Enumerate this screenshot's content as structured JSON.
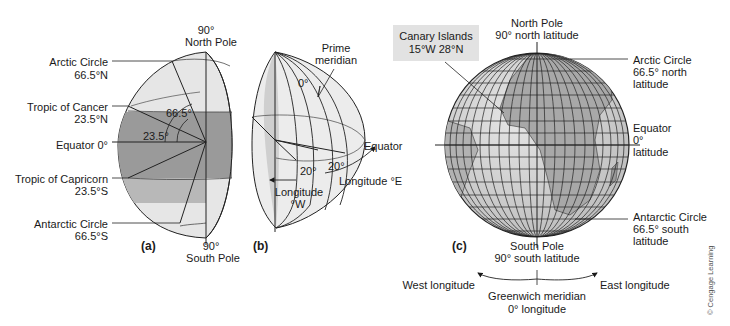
{
  "panel_a": {
    "tag": "(a)",
    "north_pole": {
      "deg": "90°",
      "name": "North Pole"
    },
    "south_pole": {
      "deg": "90°",
      "name": "South Pole"
    },
    "arctic_circle": {
      "name": "Arctic Circle",
      "value": "66.5°N"
    },
    "tropic_cancer": {
      "name": "Tropic of Cancer",
      "value": "23.5°N"
    },
    "equator": {
      "name": "Equator 0°"
    },
    "tropic_capricorn": {
      "name": "Tropic of Capricorn",
      "value": "23.5°S"
    },
    "antarctic_circle": {
      "name": "Antarctic Circle",
      "value": "66.5°S"
    },
    "angle_large": "66.5°",
    "angle_small": "23.5°"
  },
  "panel_b": {
    "tag": "(b)",
    "prime_meridian": {
      "line1": "Prime",
      "line2": "meridian"
    },
    "zero": "0°",
    "equator": "Equator",
    "angle_w": "20°",
    "angle_e": "20°",
    "longitude_e": "Longitude °E",
    "longitude_w": {
      "line1": "Longitude",
      "line2": "°W"
    }
  },
  "panel_c": {
    "tag": "(c)",
    "canary_islands": {
      "name": "Canary Islands",
      "coords": "15°W 28°N"
    },
    "north_pole": {
      "name": "North Pole",
      "lat": "90° north latitude"
    },
    "arctic_circle": {
      "line1": "Arctic Circle",
      "line2": "66.5° north",
      "line3": "latitude"
    },
    "equator": {
      "line1": "Equator",
      "line2": "0°",
      "line3": "latitude"
    },
    "antarctic_circle": {
      "line1": "Antarctic Circle",
      "line2": "66.5° south",
      "line3": "latitude"
    },
    "south_pole": {
      "name": "South Pole",
      "lat": "90° south latitude"
    },
    "west_longitude": "West longitude",
    "east_longitude": "East longitude",
    "greenwich": {
      "line1": "Greenwich meridian",
      "line2": "0° longitude"
    }
  },
  "credit": "© Cengage Learning",
  "colors": {
    "shade_dark": "#9a9a9a",
    "shade_light": "#e4e4e4",
    "land": "#a8a8a8",
    "ocean": "#d2d2d2"
  }
}
